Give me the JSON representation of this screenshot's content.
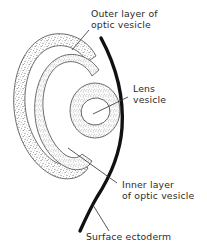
{
  "figure": {
    "background_color": "#ffffff",
    "ink_color": "#2b2b2b",
    "ectoderm_color": "#111111",
    "stipple_color": "#555555"
  },
  "labels": {
    "outer_layer": {
      "line1": "Outer layer of",
      "line2": "optic vesicle"
    },
    "lens_vesicle": {
      "line1": "Lens",
      "line2": "vesicle"
    },
    "inner_layer": {
      "line1": "Inner layer",
      "line2": "of optic vesicle"
    },
    "surface_ectoderm": {
      "line1": "Surface ectoderm"
    }
  },
  "structures": [
    {
      "name": "outer-layer-of-optic-vesicle",
      "fill": "stipple"
    },
    {
      "name": "inner-layer-of-optic-vesicle",
      "fill": "stipple"
    },
    {
      "name": "lens-vesicle",
      "fill": "stipple-ring"
    },
    {
      "name": "lens-lumen",
      "fill": "none"
    },
    {
      "name": "surface-ectoderm",
      "fill": "solid-thick-line"
    }
  ]
}
